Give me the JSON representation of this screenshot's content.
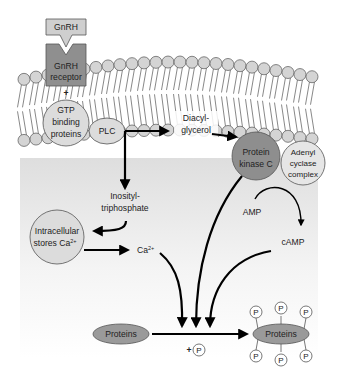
{
  "colors": {
    "background": "#ffffff",
    "cytoplasm_top": "#e3e3e3",
    "cytoplasm_bottom": "#ffffff",
    "lipid_head": "#d4d4d4",
    "lipid_outline": "#555555",
    "receptor_fill": "#8f8f8f",
    "ligand_fill": "#cfcfcf",
    "light_node": "#dcdcdc",
    "dark_node": "#8e8e8e",
    "arrow": "#000000"
  },
  "ligand": {
    "label": "GnRH"
  },
  "receptor": {
    "line1": "GnRH",
    "line2": "receptor"
  },
  "plus_sign": "+",
  "nodes": {
    "gtp": {
      "line1": "GTP",
      "line2": "binding",
      "line3": "proteins"
    },
    "plc": {
      "label": "PLC"
    },
    "dag": {
      "line1": "Diacyl-",
      "line2": "glycerol"
    },
    "pkc": {
      "line1": "Protein",
      "line2": "kinase C"
    },
    "adenyl": {
      "line1": "Adenyl",
      "line2": "cyclase",
      "line3": "complex"
    },
    "ip3": {
      "line1": "Inosityl-",
      "line2": "triphosphate"
    },
    "stores": {
      "line1": "Intracellular",
      "line2": "stores Ca",
      "sup": "2+"
    },
    "ca": {
      "label": "Ca",
      "sup": "2+"
    },
    "amp": {
      "label": "AMP"
    },
    "camp": {
      "label": "cAMP"
    },
    "proteins_in": {
      "label": "Proteins"
    },
    "phosphate": {
      "plus": "+",
      "label": "P"
    },
    "proteins_out": {
      "label": "Proteins",
      "phosphates": [
        "P",
        "P",
        "P",
        "P",
        "P",
        "P"
      ]
    }
  }
}
